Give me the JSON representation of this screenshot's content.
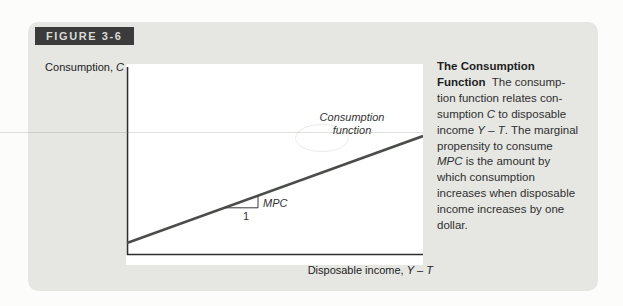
{
  "colors": {
    "page_bg": "#fcfcfa",
    "panel_bg": "#e6e7e3",
    "tab_bg": "#3b3b3b",
    "tab_text": "#d9d9d5",
    "plot_bg": "#ffffff",
    "axis": "#2e2e2c",
    "curve": "#4b4d4a",
    "text": "#2f2f2f"
  },
  "figure_tab": {
    "label": "FIGURE 3-6"
  },
  "chart": {
    "y_axis_label": [
      {
        "t": "Consumption, ",
        "s": "n"
      },
      {
        "t": "C",
        "s": "i"
      }
    ],
    "x_axis_label": [
      {
        "t": "Disposable income, ",
        "s": "n"
      },
      {
        "t": "Y",
        "s": "i"
      },
      {
        "t": " – ",
        "s": "n"
      },
      {
        "t": "T",
        "s": "i"
      }
    ],
    "curve_label_line1": "Consumption",
    "curve_label_line2": "function",
    "slope_label": "MPC",
    "slope_run_label": "1"
  },
  "chart_data": {
    "type": "line",
    "title": "",
    "xlabel": "Disposable income, Y – T",
    "ylabel": "Consumption, C",
    "series": [
      {
        "name": "Consumption function",
        "qualitative": "upward-sloping straight line with positive vertical intercept; slope labeled MPC over a run of 1"
      }
    ],
    "annotations": [
      "MPC",
      "1"
    ],
    "axis_values_shown": false
  },
  "caption": {
    "lines": [
      [
        {
          "t": "The Consumption",
          "s": "b"
        }
      ],
      [
        {
          "t": "Function",
          "s": "b"
        },
        {
          "t": "  The consump-",
          "s": "n"
        }
      ],
      [
        {
          "t": "tion function relates con-",
          "s": "n"
        }
      ],
      [
        {
          "t": "sumption ",
          "s": "n"
        },
        {
          "t": "C",
          "s": "i"
        },
        {
          "t": " to disposable",
          "s": "n"
        }
      ],
      [
        {
          "t": "income ",
          "s": "n"
        },
        {
          "t": "Y",
          "s": "i"
        },
        {
          "t": " – ",
          "s": "n"
        },
        {
          "t": "T",
          "s": "i"
        },
        {
          "t": ". The marginal",
          "s": "n"
        }
      ],
      [
        {
          "t": "propensity to consume",
          "s": "n"
        }
      ],
      [
        {
          "t": "MPC",
          "s": "i"
        },
        {
          "t": " is the amount by",
          "s": "n"
        }
      ],
      [
        {
          "t": "which consumption",
          "s": "n"
        }
      ],
      [
        {
          "t": "increases when disposable",
          "s": "n"
        }
      ],
      [
        {
          "t": "income increases by one",
          "s": "n"
        }
      ],
      [
        {
          "t": "dollar.",
          "s": "n"
        }
      ]
    ]
  }
}
